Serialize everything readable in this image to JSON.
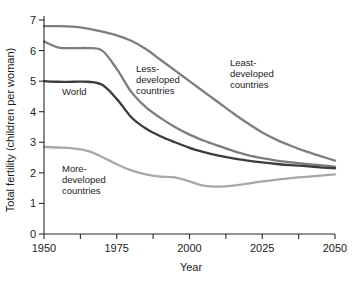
{
  "chart_data": {
    "type": "line",
    "title": "",
    "xlabel": "Year",
    "ylabel": "Total fertility (children per woman)",
    "xlim": [
      1950,
      2050
    ],
    "ylim": [
      0,
      7
    ],
    "grid": false,
    "legend_position": "inline-annotations",
    "x_ticks": [
      1950,
      1975,
      2000,
      2025,
      2050
    ],
    "x_tick_labels": [
      "1950",
      "1975",
      "2000",
      "2025",
      "2050"
    ],
    "x_minor_ticks": [
      1962.5,
      1987.5,
      2012.5,
      2037.5
    ],
    "y_ticks": [
      0,
      1,
      2,
      3,
      4,
      5,
      6,
      7
    ],
    "y_tick_labels": [
      "0",
      "1",
      "2",
      "3",
      "4",
      "5",
      "6",
      "7"
    ],
    "x": [
      1950,
      1955,
      1960,
      1965,
      1970,
      1975,
      1980,
      1985,
      1990,
      1995,
      2000,
      2005,
      2010,
      2015,
      2020,
      2025,
      2030,
      2035,
      2040,
      2045,
      2050
    ],
    "series": [
      {
        "name": "Least-developed countries",
        "color": "#7d7d7d",
        "values": [
          6.8,
          6.8,
          6.78,
          6.72,
          6.62,
          6.5,
          6.32,
          6.05,
          5.7,
          5.35,
          5.0,
          4.65,
          4.3,
          3.95,
          3.62,
          3.32,
          3.08,
          2.88,
          2.7,
          2.55,
          2.4
        ]
      },
      {
        "name": "Less-developed countries",
        "color": "#7d7d7d",
        "values": [
          6.3,
          6.1,
          6.08,
          6.08,
          6.0,
          5.4,
          4.65,
          4.15,
          3.8,
          3.5,
          3.25,
          3.05,
          2.88,
          2.72,
          2.58,
          2.48,
          2.4,
          2.34,
          2.29,
          2.25,
          2.2
        ]
      },
      {
        "name": "World",
        "color": "#3c3c3c",
        "values": [
          5.0,
          4.98,
          4.98,
          4.98,
          4.88,
          4.42,
          3.82,
          3.45,
          3.2,
          3.0,
          2.82,
          2.68,
          2.56,
          2.47,
          2.4,
          2.34,
          2.29,
          2.25,
          2.22,
          2.18,
          2.15
        ]
      },
      {
        "name": "More-developed countries",
        "color": "#a8a8a8",
        "values": [
          2.85,
          2.83,
          2.8,
          2.72,
          2.52,
          2.28,
          2.08,
          1.95,
          1.88,
          1.85,
          1.72,
          1.58,
          1.55,
          1.58,
          1.65,
          1.72,
          1.78,
          1.83,
          1.87,
          1.91,
          1.95
        ]
      }
    ],
    "annotations": [
      {
        "text_lines": [
          "Less-",
          "developed",
          "countries"
        ],
        "x": 136,
        "y": 72
      },
      {
        "text_lines": [
          "Least-",
          "developed",
          "countries"
        ],
        "x": 230,
        "y": 66
      },
      {
        "text_lines": [
          "World"
        ],
        "x": 62,
        "y": 95
      },
      {
        "text_lines": [
          "More-",
          "developed",
          "countries"
        ],
        "x": 62,
        "y": 172
      }
    ]
  }
}
